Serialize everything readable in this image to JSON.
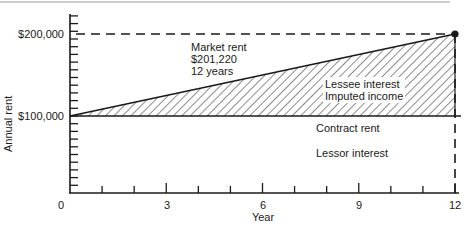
{
  "chart_data": {
    "type": "area",
    "title": "",
    "xlabel": "Year",
    "ylabel": "Annual rent",
    "xlim": [
      0,
      12
    ],
    "ylim": [
      0,
      220000
    ],
    "x_ticks": [
      0,
      3,
      6,
      9,
      12
    ],
    "x_tick_labels": [
      "0",
      "3",
      "6",
      "9",
      "12"
    ],
    "x_minor_ticks": [
      1,
      2,
      4,
      5,
      7,
      8,
      10,
      11
    ],
    "y_ticks": [
      100000,
      200000
    ],
    "y_tick_labels": [
      "$100,000",
      "$200,000"
    ],
    "y_minor_tick_step": 10000,
    "grid": false,
    "legend": null,
    "series": [
      {
        "name": "Contract rent",
        "style": "solid",
        "x": [
          0,
          12
        ],
        "y": [
          100000,
          100000
        ]
      },
      {
        "name": "Market rent",
        "style": "solid",
        "x": [
          0,
          12
        ],
        "y": [
          100000,
          201220
        ]
      },
      {
        "name": "Market rent reference (horizontal)",
        "style": "dashed",
        "x": [
          0,
          12
        ],
        "y": [
          201220,
          201220
        ]
      },
      {
        "name": "Year 12 reference (vertical)",
        "style": "dashed",
        "x": [
          12,
          12
        ],
        "y": [
          0,
          201220
        ]
      }
    ],
    "shaded_region": {
      "name": "Lessee interest / Imputed income",
      "pattern": "diagonal-hatch",
      "between": [
        "Contract rent",
        "Market rent"
      ]
    },
    "annotations": [
      {
        "text": [
          "Market rent",
          "$201,220",
          "12 years"
        ],
        "x": 4.2,
        "y": 185000
      },
      {
        "text": [
          "Lessee interest",
          "Imputed income"
        ],
        "x": 8.1,
        "y": 140000
      },
      {
        "text": [
          "Contract rent"
        ],
        "x": 8.1,
        "y": 93000
      },
      {
        "text": [
          "Lessor interest"
        ],
        "x": 8.1,
        "y": 70000
      }
    ],
    "endpoint_marker": {
      "x": 12,
      "y": 201220
    }
  },
  "labels": {
    "ylabel": "Annual rent",
    "xlabel": "Year",
    "ytick_200k": "$200,000",
    "ytick_100k": "$100,000",
    "xtick_0": "0",
    "xtick_3": "3",
    "xtick_6": "6",
    "xtick_9": "9",
    "xtick_12": "12",
    "market_rent_1": "Market rent",
    "market_rent_2": "$201,220",
    "market_rent_3": "12 years",
    "lessee_1": "Lessee interest",
    "lessee_2": "Imputed income",
    "contract_rent": "Contract rent",
    "lessor": "Lessor interest"
  },
  "colors": {
    "ink": "#1a1a1a",
    "top_rule": "#9a9a9a",
    "background": "#ffffff"
  }
}
